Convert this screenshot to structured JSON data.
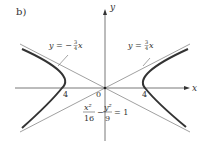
{
  "figure": {
    "panel_label": "b)",
    "axis_x_label": "x",
    "axis_y_label": "y",
    "origin_label": "0",
    "vertex_left_label": "4",
    "vertex_right_label": "4",
    "asymptote_left_label": "y = −¾x",
    "asymptote_left_prefix": "y = −",
    "asymptote_right_prefix": "y = ",
    "asymptote_num": "3",
    "asymptote_den": "4",
    "asymptote_var": "x",
    "equation": {
      "term1_num": "x²",
      "term1_den": "16",
      "minus": "−",
      "term2_num": "y²",
      "term2_den": "9",
      "rhs": "= 1"
    },
    "colors": {
      "curve": "#333333",
      "asymptote": "#777777",
      "axis": "#444444"
    }
  }
}
